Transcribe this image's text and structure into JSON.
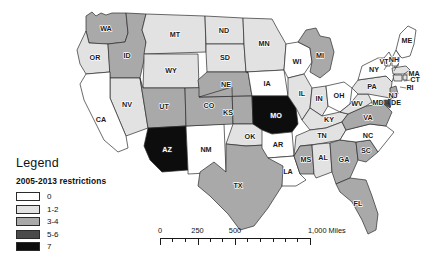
{
  "map": {
    "title": "",
    "background_color": "#ffffff",
    "border_color": "#2b2b2b",
    "palette": {
      "c0": "#ffffff",
      "c1_2": "#e2e2e2",
      "c3_4": "#a9a9a9",
      "c5_6": "#4a4a4a",
      "c7": "#0d0d0d"
    },
    "states": [
      {
        "code": "WA",
        "bucket": "3-4",
        "value": 3
      },
      {
        "code": "OR",
        "bucket": "1-2",
        "value": 1
      },
      {
        "code": "ID",
        "bucket": "3-4",
        "value": 3
      },
      {
        "code": "MT",
        "bucket": "1-2",
        "value": 1
      },
      {
        "code": "WY",
        "bucket": "1-2",
        "value": 1
      },
      {
        "code": "NV",
        "bucket": "1-2",
        "value": 1
      },
      {
        "code": "CA",
        "bucket": "0",
        "value": 0
      },
      {
        "code": "UT",
        "bucket": "3-4",
        "value": 3
      },
      {
        "code": "AZ",
        "bucket": "7",
        "value": 7
      },
      {
        "code": "NM",
        "bucket": "0",
        "value": 0
      },
      {
        "code": "CO",
        "bucket": "3-4",
        "value": 3
      },
      {
        "code": "ND",
        "bucket": "1-2",
        "value": 1
      },
      {
        "code": "SD",
        "bucket": "1-2",
        "value": 1
      },
      {
        "code": "NE",
        "bucket": "3-4",
        "value": 3
      },
      {
        "code": "KS",
        "bucket": "3-4",
        "value": 3
      },
      {
        "code": "OK",
        "bucket": "1-2",
        "value": 1
      },
      {
        "code": "TX",
        "bucket": "3-4",
        "value": 3
      },
      {
        "code": "MN",
        "bucket": "1-2",
        "value": 1
      },
      {
        "code": "IA",
        "bucket": "0",
        "value": 0
      },
      {
        "code": "MO",
        "bucket": "7",
        "value": 7
      },
      {
        "code": "AR",
        "bucket": "0",
        "value": 0
      },
      {
        "code": "LA",
        "bucket": "0",
        "value": 0
      },
      {
        "code": "WI",
        "bucket": "0",
        "value": 0
      },
      {
        "code": "IL",
        "bucket": "1-2",
        "value": 1
      },
      {
        "code": "MI",
        "bucket": "3-4",
        "value": 3
      },
      {
        "code": "IN",
        "bucket": "1-2",
        "value": 1
      },
      {
        "code": "OH",
        "bucket": "0",
        "value": 0
      },
      {
        "code": "KY",
        "bucket": "1-2",
        "value": 1
      },
      {
        "code": "TN",
        "bucket": "1-2",
        "value": 1
      },
      {
        "code": "MS",
        "bucket": "3-4",
        "value": 3
      },
      {
        "code": "AL",
        "bucket": "1-2",
        "value": 1
      },
      {
        "code": "GA",
        "bucket": "3-4",
        "value": 3
      },
      {
        "code": "FL",
        "bucket": "3-4",
        "value": 3
      },
      {
        "code": "SC",
        "bucket": "3-4",
        "value": 3
      },
      {
        "code": "NC",
        "bucket": "0",
        "value": 0
      },
      {
        "code": "VA",
        "bucket": "3-4",
        "value": 3
      },
      {
        "code": "WV",
        "bucket": "1-2",
        "value": 1
      },
      {
        "code": "MD",
        "bucket": "5-6",
        "value": 5
      },
      {
        "code": "DE",
        "bucket": "5-6",
        "value": 5
      },
      {
        "code": "PA",
        "bucket": "1-2",
        "value": 1
      },
      {
        "code": "NJ",
        "bucket": "3-4",
        "value": 3
      },
      {
        "code": "NY",
        "bucket": "0",
        "value": 0
      },
      {
        "code": "CT",
        "bucket": "1-2",
        "value": 1
      },
      {
        "code": "RI",
        "bucket": "1-2",
        "value": 1
      },
      {
        "code": "MA",
        "bucket": "1-2",
        "value": 1
      },
      {
        "code": "VT",
        "bucket": "0",
        "value": 0
      },
      {
        "code": "NH",
        "bucket": "0",
        "value": 0
      },
      {
        "code": "ME",
        "bucket": "0",
        "value": 0
      }
    ]
  },
  "legend": {
    "title": "Legend",
    "subtitle": "2005-2013 restrictions",
    "entries": [
      {
        "label": "0",
        "color": "#ffffff"
      },
      {
        "label": "1-2",
        "color": "#e2e2e2"
      },
      {
        "label": "3-4",
        "color": "#a9a9a9"
      },
      {
        "label": "5-6",
        "color": "#4a4a4a"
      },
      {
        "label": "7",
        "color": "#0d0d0d"
      }
    ]
  },
  "scalebar": {
    "labels": [
      "0",
      "250",
      "500",
      "1,000 Miles"
    ],
    "label_positions": [
      0,
      25,
      50,
      100
    ],
    "tick_positions": [
      0,
      8.3,
      16.6,
      25,
      33.3,
      41.6,
      50,
      58.3,
      66.6,
      75,
      83.3,
      91.6,
      100
    ],
    "major_ticks": [
      0,
      25,
      50,
      100
    ]
  }
}
